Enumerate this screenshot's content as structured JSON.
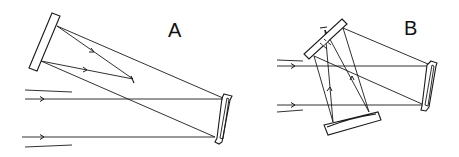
{
  "figure": {
    "panels": [
      {
        "label": "A",
        "components": [
          "upper-left flat/secondary mirror",
          "right primary mirror",
          "focus point"
        ],
        "incoming_beam_rays": 2
      },
      {
        "label": "B",
        "components": [
          "upper tilted flat mirror with central hole",
          "right mirror",
          "lower curved mirror",
          "focus point"
        ],
        "incoming_beam_rays": 2
      }
    ]
  },
  "colors": {
    "ink": "#1a1a1a",
    "background": "#ffffff"
  }
}
